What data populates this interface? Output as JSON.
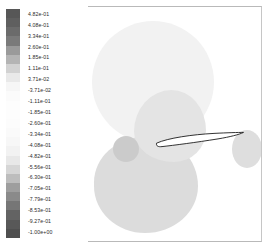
{
  "figure": {
    "title": "",
    "kind": "cfd-pressure-contour-plot"
  },
  "colorbar": {
    "name": "pressure-coefficient-colorbar",
    "orientation": "vertical",
    "colormap": "grayscale",
    "ticks": [
      "4.82e-01",
      "4.08e-01",
      "3.34e-01",
      "2.60e-01",
      "1.85e-01",
      "1.11e-01",
      "3.71e-02",
      "-3.71e-02",
      "-1.11e-01",
      "-1.85e-01",
      "-2.60e-01",
      "-3.34e-01",
      "-4.08e-01",
      "-4.82e-01",
      "-5.56e-01",
      "-6.30e-01",
      "-7.05e-01",
      "-7.79e-01",
      "-8.53e-01",
      "-9.27e-01",
      "-1.00e+00"
    ],
    "band_colors": [
      "#575757",
      "#5f5f5f",
      "#6b6b6b",
      "#7a7a7a",
      "#9a9a9a",
      "#b4b4b4",
      "#d2d2d2",
      "#e9e9e9",
      "#f6f6f6",
      "#fbfbfb",
      "#fdfdfd",
      "#fdfdfd",
      "#fcfcfc",
      "#fafafa",
      "#f7f7f7",
      "#f2f2f2",
      "#e8e8e8",
      "#d6d6d6",
      "#bdbdbd",
      "#9e9e9e",
      "#8a8a8a",
      "#767676",
      "#636363",
      "#585858",
      "#4f4f4f"
    ]
  },
  "chart_data": {
    "type": "heatmap",
    "title": "",
    "xlabel": "",
    "ylabel": "",
    "colorbar_label": "",
    "grid": false,
    "legend_position": "left",
    "colormap": "grayscale",
    "value_range": [
      -1.0,
      0.482
    ],
    "tick_values": [
      0.482,
      0.408,
      0.334,
      0.26,
      0.185,
      0.111,
      0.0371,
      -0.0371,
      -0.111,
      -0.185,
      -0.26,
      -0.334,
      -0.408,
      -0.482,
      -0.556,
      -0.63,
      -0.705,
      -0.779,
      -0.853,
      -0.927,
      -1.0
    ],
    "tick_labels": [
      "4.82e-01",
      "4.08e-01",
      "3.34e-01",
      "2.60e-01",
      "1.85e-01",
      "1.11e-01",
      "3.71e-02",
      "-3.71e-02",
      "-1.11e-01",
      "-1.85e-01",
      "-2.60e-01",
      "-3.34e-01",
      "-4.08e-01",
      "-4.82e-01",
      "-5.56e-01",
      "-6.30e-01",
      "-7.05e-01",
      "-7.79e-01",
      "-8.53e-01",
      "-9.27e-01",
      "-1.00e+00"
    ],
    "regions": [
      {
        "name": "upper-suction-lobe",
        "approx_value": -0.11,
        "fill": "#f2f2f2"
      },
      {
        "name": "mid-suction-lobe",
        "approx_value": -0.26,
        "fill": "#e4e4e4"
      },
      {
        "name": "lower-pressure-lobe",
        "approx_value": -0.33,
        "fill": "#dcdcdc"
      },
      {
        "name": "stagnation-core",
        "approx_value": -0.48,
        "fill": "#cbcbcb"
      },
      {
        "name": "trailing-edge-lobe",
        "approx_value": -0.3,
        "fill": "#dedede"
      }
    ],
    "body": {
      "name": "airfoil",
      "outline_color": "#1a1a1a",
      "fill": "#ffffff"
    }
  }
}
